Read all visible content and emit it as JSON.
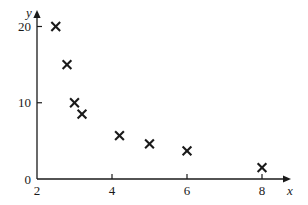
{
  "chart_data": {
    "type": "scatter",
    "title": "",
    "subtitle": "",
    "xlabel": "x",
    "ylabel": "y",
    "xlim": [
      2,
      8.6
    ],
    "ylim": [
      0,
      21.5
    ],
    "xticks": [
      2,
      4,
      6,
      8
    ],
    "xticklabels": [
      "2",
      "4",
      "6",
      "8"
    ],
    "yticks": [
      0,
      10,
      20
    ],
    "yticklabels": [
      "0",
      "10",
      "20"
    ],
    "grid": false,
    "legend": false,
    "legend_position": "none",
    "marker": "x",
    "marker_color": "#1a1a1a",
    "axis_color": "#1a1a1a",
    "background_color": "#ffffff",
    "axis_arrows": true,
    "series": [
      {
        "name": "data",
        "points": [
          {
            "x": 2.5,
            "y": 20.0
          },
          {
            "x": 2.8,
            "y": 15.0
          },
          {
            "x": 3.0,
            "y": 10.0
          },
          {
            "x": 3.2,
            "y": 8.5
          },
          {
            "x": 4.2,
            "y": 5.7
          },
          {
            "x": 5.0,
            "y": 4.6
          },
          {
            "x": 6.0,
            "y": 3.7
          },
          {
            "x": 8.0,
            "y": 1.5
          }
        ]
      }
    ]
  },
  "axes": {
    "x_axis_label": "x",
    "y_axis_label": "y",
    "origin_label": "0"
  }
}
